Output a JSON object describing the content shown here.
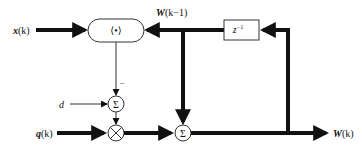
{
  "diagram": {
    "type": "block-diagram",
    "colors": {
      "line": "#111111",
      "background": "#ffffff",
      "box_stroke": "#333333"
    },
    "signals": {
      "input_x": {
        "name": "x",
        "arg": "(k)"
      },
      "feedback_w": {
        "name": "W",
        "arg": "(k−1)"
      },
      "desired_d": {
        "name": "d"
      },
      "input_q": {
        "name": "q",
        "arg": "(k)"
      },
      "output_w": {
        "name": "W",
        "arg": "(k)"
      }
    },
    "blocks": {
      "inner_product": {
        "symbol": "⟨•⟩",
        "description": "inner product"
      },
      "delay": {
        "symbol": "z",
        "exponent": "−1",
        "description": "unit delay"
      },
      "sum_error": {
        "symbol": "Σ",
        "minus_sign": "−"
      },
      "multiplier": {
        "symbol": "×"
      },
      "sum_update": {
        "symbol": "Σ"
      }
    }
  }
}
